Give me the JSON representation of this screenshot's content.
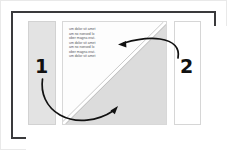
{
  "figure": {
    "background_color": "#ffffff",
    "frame_color": "#3a3a3c"
  },
  "panels": [
    {
      "name": "left-panel",
      "fill": "#e3e3e3",
      "border": "#d2d2d2",
      "content": ""
    },
    {
      "name": "center-panel",
      "fill": "#fdfdfd",
      "border": "#d8d8d8",
      "shade_fill": "#dcdcdc",
      "diagonal_line_color": "#b4b4b4"
    },
    {
      "name": "right-panel",
      "fill": "#ffffff",
      "border": "#d6d6d6",
      "content": ""
    }
  ],
  "body_text": {
    "lines": [
      "um dolor sit amet",
      "am no nonsed lo",
      "ober magna erat.",
      "um dolor sit amet",
      "am no nonsed lo",
      "ober magna erat.",
      "um dolor sit amet"
    ],
    "color": "#54545c"
  },
  "callouts": [
    {
      "label": "1",
      "name": "callout-number-1",
      "arrow_color": "#111111",
      "arrow_description": "curves down from label 1 and sweeps right, pointing up-right into the shaded triangle"
    },
    {
      "label": "2",
      "name": "callout-number-2",
      "arrow_color": "#111111",
      "arrow_description": "curves up-left from label 2, pointing left at the diagonal line"
    }
  ]
}
